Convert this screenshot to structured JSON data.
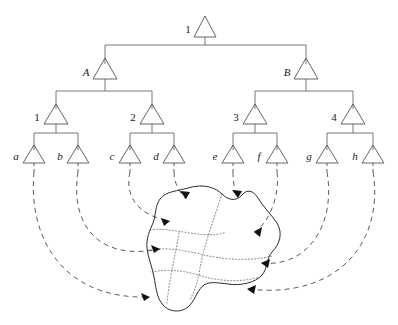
{
  "diagram": {
    "type": "tree-with-region-mapping",
    "levels": 4,
    "colors": {
      "node_stroke": "#555555",
      "edge_stroke": "#6a6a6a",
      "arc_stroke": "#4a4a4a",
      "blob_stroke": "#2b2b2b",
      "partition_stroke": "#6d6d6d",
      "arrow_fill": "#111111",
      "background": "#ffffff"
    }
  },
  "tree": {
    "root": {
      "id": "root",
      "label": "1",
      "x": 205,
      "y": 30,
      "label_style": "roman"
    },
    "level2": [
      {
        "id": "A",
        "label": "A",
        "x": 105,
        "y": 72,
        "label_style": "italic"
      },
      {
        "id": "B",
        "label": "B",
        "x": 306,
        "y": 72,
        "label_style": "italic"
      }
    ],
    "level3": [
      {
        "id": "n1",
        "label": "1",
        "x": 56,
        "y": 117,
        "label_style": "roman"
      },
      {
        "id": "n2",
        "label": "2",
        "x": 152,
        "y": 117,
        "label_style": "roman"
      },
      {
        "id": "n3",
        "label": "3",
        "x": 255,
        "y": 117,
        "label_style": "roman"
      },
      {
        "id": "n4",
        "label": "4",
        "x": 353,
        "y": 117,
        "label_style": "roman"
      }
    ],
    "leaves": [
      {
        "id": "a",
        "label": "a",
        "x": 34,
        "y": 158,
        "label_style": "italic"
      },
      {
        "id": "b",
        "label": "b",
        "x": 78,
        "y": 158,
        "label_style": "italic"
      },
      {
        "id": "c",
        "label": "c",
        "x": 130,
        "y": 158,
        "label_style": "italic"
      },
      {
        "id": "d",
        "label": "d",
        "x": 174,
        "y": 158,
        "label_style": "italic"
      },
      {
        "id": "e",
        "label": "e",
        "x": 233,
        "y": 158,
        "label_style": "italic"
      },
      {
        "id": "f",
        "label": "f",
        "x": 277,
        "y": 158,
        "label_style": "italic"
      },
      {
        "id": "g",
        "label": "g",
        "x": 327,
        "y": 158,
        "label_style": "italic"
      },
      {
        "id": "h",
        "label": "h",
        "x": 373,
        "y": 158,
        "label_style": "italic"
      }
    ],
    "edges": [
      {
        "from": "root",
        "to": "A"
      },
      {
        "from": "root",
        "to": "B"
      },
      {
        "from": "A",
        "to": "n1"
      },
      {
        "from": "A",
        "to": "n2"
      },
      {
        "from": "B",
        "to": "n3"
      },
      {
        "from": "B",
        "to": "n4"
      },
      {
        "from": "n1",
        "to": "a"
      },
      {
        "from": "n1",
        "to": "b"
      },
      {
        "from": "n2",
        "to": "c"
      },
      {
        "from": "n2",
        "to": "d"
      },
      {
        "from": "n3",
        "to": "e"
      },
      {
        "from": "n3",
        "to": "f"
      },
      {
        "from": "n4",
        "to": "g"
      },
      {
        "from": "n4",
        "to": "h"
      }
    ]
  },
  "mapping_arcs": [
    {
      "from_leaf": "a",
      "to_region": "r-left-lower",
      "arrow_at": [
        152,
        296
      ]
    },
    {
      "from_leaf": "b",
      "to_region": "r-left-mid",
      "arrow_at": [
        163,
        248
      ]
    },
    {
      "from_leaf": "c",
      "to_region": "r-left-upper",
      "arrow_at": [
        173,
        220
      ]
    },
    {
      "from_leaf": "d",
      "to_region": "r-top-left",
      "arrow_at": [
        188,
        199
      ]
    },
    {
      "from_leaf": "e",
      "to_region": "r-top-right",
      "arrow_at": [
        236,
        198
      ]
    },
    {
      "from_leaf": "f",
      "to_region": "r-right-upper",
      "arrow_at": [
        252,
        232
      ]
    },
    {
      "from_leaf": "g",
      "to_region": "r-right-mid",
      "arrow_at": [
        258,
        262
      ]
    },
    {
      "from_leaf": "h",
      "to_region": "r-right-lower",
      "arrow_at": [
        244,
        287
      ]
    }
  ],
  "region": {
    "name": "partitioned-blob",
    "subregion_count": 8,
    "boundary_style": "solid",
    "partition_style": "dotted"
  }
}
